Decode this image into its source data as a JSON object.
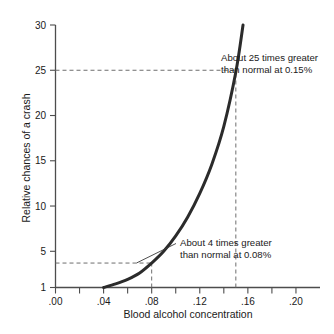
{
  "chart_data": {
    "type": "line",
    "title": "",
    "xlabel": "Blood alcohol concentration",
    "ylabel": "Relative chances of a crash",
    "xlim": [
      0.0,
      0.22
    ],
    "ylim": [
      1,
      30
    ],
    "grid": false,
    "legend": "none",
    "x_ticks": [
      {
        "value": 0.0,
        "label": ".00",
        "major": true
      },
      {
        "value": 0.02,
        "label": "",
        "major": false
      },
      {
        "value": 0.04,
        "label": ".04",
        "major": true
      },
      {
        "value": 0.06,
        "label": "",
        "major": false
      },
      {
        "value": 0.08,
        "label": ".08",
        "major": true
      },
      {
        "value": 0.1,
        "label": "",
        "major": false
      },
      {
        "value": 0.12,
        "label": ".12",
        "major": true
      },
      {
        "value": 0.14,
        "label": "",
        "major": false
      },
      {
        "value": 0.16,
        "label": ".16",
        "major": true
      },
      {
        "value": 0.18,
        "label": "",
        "major": false
      },
      {
        "value": 0.2,
        "label": ".20",
        "major": true
      }
    ],
    "y_ticks": [
      {
        "value": 1,
        "label": "1"
      },
      {
        "value": 5,
        "label": "5"
      },
      {
        "value": 10,
        "label": "10"
      },
      {
        "value": 15,
        "label": "15"
      },
      {
        "value": 20,
        "label": "20"
      },
      {
        "value": 25,
        "label": "25"
      },
      {
        "value": 30,
        "label": "30"
      }
    ],
    "series": [
      {
        "name": "Relative crash risk",
        "x": [
          0.04,
          0.05,
          0.06,
          0.07,
          0.08,
          0.09,
          0.1,
          0.11,
          0.12,
          0.13,
          0.14,
          0.15,
          0.156
        ],
        "values": [
          1.0,
          1.4,
          1.9,
          2.6,
          3.7,
          5.0,
          6.7,
          8.8,
          11.4,
          14.6,
          18.8,
          24.8,
          30.0
        ]
      }
    ],
    "annotations": [
      {
        "id": "annot-25x",
        "line1": "About 25 times greater",
        "line2": "than normal at 0.15%",
        "point_x": 0.15,
        "point_y": 25
      },
      {
        "id": "annot-4x",
        "line1": "About 4 times greater",
        "line2": "than normal at 0.08%",
        "point_x": 0.08,
        "point_y": 3.7
      }
    ],
    "guides": [
      {
        "id": "guide-25-horizontal",
        "orientation": "horizontal",
        "value": 25,
        "from": 0.0,
        "to": 0.15
      },
      {
        "id": "guide-15pct-vertical",
        "orientation": "vertical",
        "value": 0.15,
        "from": 1,
        "to": 25
      },
      {
        "id": "guide-4-horizontal",
        "orientation": "horizontal",
        "value": 3.7,
        "from": 0.0,
        "to": 0.08
      },
      {
        "id": "guide-8pct-vertical",
        "orientation": "vertical",
        "value": 0.08,
        "from": 1,
        "to": 3.7
      }
    ],
    "colors": {
      "curve": "#2b2b2b",
      "axis": "#4d4d4d",
      "guide": "#6e6e6e",
      "text": "#1a1a1a",
      "background": "#ffffff"
    }
  }
}
